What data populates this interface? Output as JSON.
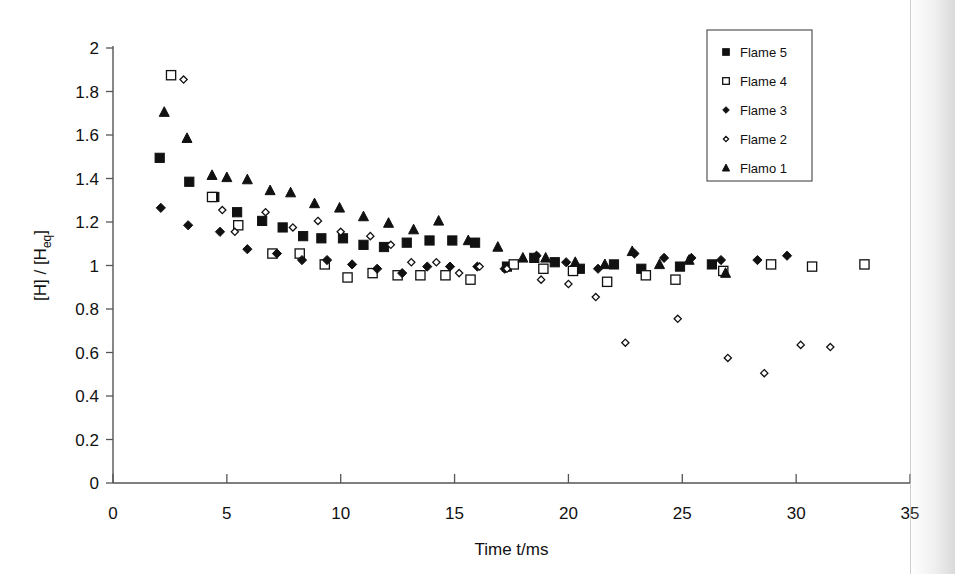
{
  "chart_data": {
    "type": "scatter",
    "title": "",
    "xlabel": "Time t/ms",
    "ylabel": "[H] / [Heq]",
    "ylabel_base": "[H] / [H",
    "ylabel_sub": "eq",
    "ylabel_close": "]",
    "xlim": [
      0,
      35
    ],
    "ylim": [
      0,
      2
    ],
    "xticks": [
      0,
      5,
      10,
      15,
      20,
      25,
      30,
      35
    ],
    "yticks": [
      0,
      0.2,
      0.4,
      0.6,
      0.8,
      1,
      1.2,
      1.4,
      1.6,
      1.8,
      2
    ],
    "xtick_labels": [
      "0",
      "5",
      "10",
      "15",
      "20",
      "25",
      "30",
      "35"
    ],
    "ytick_labels": [
      "0",
      "0.2",
      "0.4",
      "0.6",
      "0.8",
      "1",
      "1.2",
      "1.4",
      "1.6",
      "1.8",
      "2"
    ],
    "grid": false,
    "legend_position": "top-right",
    "marker_color": "#111111",
    "axis_color": "#555555",
    "series": [
      {
        "name": "Flame 5",
        "marker": "filled-square",
        "points": [
          [
            2.05,
            1.495
          ],
          [
            3.35,
            1.385
          ],
          [
            4.45,
            1.315
          ],
          [
            5.45,
            1.245
          ],
          [
            6.55,
            1.205
          ],
          [
            7.45,
            1.175
          ],
          [
            8.35,
            1.135
          ],
          [
            9.15,
            1.125
          ],
          [
            10.1,
            1.125
          ],
          [
            11.0,
            1.095
          ],
          [
            11.9,
            1.085
          ],
          [
            12.9,
            1.105
          ],
          [
            13.9,
            1.115
          ],
          [
            14.9,
            1.115
          ],
          [
            15.9,
            1.105
          ],
          [
            17.3,
            0.995
          ],
          [
            18.5,
            1.035
          ],
          [
            19.4,
            1.015
          ],
          [
            20.5,
            0.985
          ],
          [
            22.0,
            1.005
          ],
          [
            23.2,
            0.985
          ],
          [
            24.9,
            0.995
          ],
          [
            26.3,
            1.005
          ]
        ]
      },
      {
        "name": "Flame 4",
        "marker": "open-square",
        "points": [
          [
            2.55,
            1.875
          ],
          [
            4.35,
            1.315
          ],
          [
            5.5,
            1.185
          ],
          [
            7.0,
            1.055
          ],
          [
            8.2,
            1.055
          ],
          [
            9.3,
            1.005
          ],
          [
            10.3,
            0.945
          ],
          [
            11.4,
            0.965
          ],
          [
            12.5,
            0.955
          ],
          [
            13.5,
            0.955
          ],
          [
            14.6,
            0.955
          ],
          [
            15.7,
            0.935
          ],
          [
            17.6,
            1.005
          ],
          [
            18.9,
            0.985
          ],
          [
            20.2,
            0.975
          ],
          [
            21.7,
            0.925
          ],
          [
            23.4,
            0.955
          ],
          [
            24.7,
            0.935
          ],
          [
            26.8,
            0.975
          ],
          [
            28.9,
            1.005
          ],
          [
            30.7,
            0.995
          ],
          [
            33.0,
            1.005
          ]
        ]
      },
      {
        "name": "Flame 3",
        "marker": "filled-diamond",
        "points": [
          [
            2.1,
            1.265
          ],
          [
            3.3,
            1.185
          ],
          [
            4.7,
            1.155
          ],
          [
            5.9,
            1.075
          ],
          [
            7.2,
            1.055
          ],
          [
            8.3,
            1.025
          ],
          [
            9.4,
            1.025
          ],
          [
            10.5,
            1.005
          ],
          [
            11.6,
            0.985
          ],
          [
            12.7,
            0.965
          ],
          [
            13.8,
            0.995
          ],
          [
            14.8,
            0.995
          ],
          [
            16.0,
            0.995
          ],
          [
            17.2,
            0.985
          ],
          [
            18.6,
            1.045
          ],
          [
            19.9,
            1.015
          ],
          [
            21.3,
            0.985
          ],
          [
            22.9,
            1.055
          ],
          [
            24.2,
            1.035
          ],
          [
            25.4,
            1.035
          ],
          [
            26.7,
            1.025
          ],
          [
            28.3,
            1.025
          ],
          [
            29.6,
            1.045
          ]
        ]
      },
      {
        "name": "Flame 2",
        "marker": "open-diamond",
        "points": [
          [
            3.1,
            1.855
          ],
          [
            4.8,
            1.255
          ],
          [
            5.35,
            1.155
          ],
          [
            6.7,
            1.245
          ],
          [
            7.9,
            1.175
          ],
          [
            9.0,
            1.205
          ],
          [
            10.0,
            1.155
          ],
          [
            11.3,
            1.135
          ],
          [
            12.2,
            1.095
          ],
          [
            13.1,
            1.015
          ],
          [
            14.2,
            1.015
          ],
          [
            15.2,
            0.965
          ],
          [
            16.1,
            0.995
          ],
          [
            17.3,
            0.985
          ],
          [
            18.8,
            0.935
          ],
          [
            20.0,
            0.915
          ],
          [
            21.2,
            0.855
          ],
          [
            22.5,
            0.645
          ],
          [
            24.8,
            0.755
          ],
          [
            27.0,
            0.575
          ],
          [
            28.6,
            0.505
          ],
          [
            30.2,
            0.635
          ],
          [
            31.5,
            0.625
          ]
        ]
      },
      {
        "name": "Flamo 1",
        "marker": "filled-triangle",
        "points": [
          [
            2.25,
            1.705
          ],
          [
            3.25,
            1.585
          ],
          [
            4.35,
            1.415
          ],
          [
            5.0,
            1.405
          ],
          [
            5.9,
            1.395
          ],
          [
            6.9,
            1.345
          ],
          [
            7.8,
            1.335
          ],
          [
            8.85,
            1.285
          ],
          [
            9.95,
            1.265
          ],
          [
            11.0,
            1.225
          ],
          [
            12.1,
            1.195
          ],
          [
            13.2,
            1.165
          ],
          [
            14.3,
            1.205
          ],
          [
            15.6,
            1.115
          ],
          [
            16.9,
            1.085
          ],
          [
            18.0,
            1.035
          ],
          [
            19.0,
            1.035
          ],
          [
            20.3,
            1.015
          ],
          [
            21.6,
            1.005
          ],
          [
            22.8,
            1.065
          ],
          [
            24.0,
            1.005
          ],
          [
            25.3,
            1.025
          ],
          [
            26.9,
            0.965
          ]
        ]
      }
    ]
  },
  "legend": {
    "items": [
      {
        "label": "Flame 5",
        "marker": "filled-square"
      },
      {
        "label": "Flame 4",
        "marker": "open-square"
      },
      {
        "label": "Flame 3",
        "marker": "filled-diamond"
      },
      {
        "label": "Flame 2",
        "marker": "open-diamond"
      },
      {
        "label": "Flamo 1",
        "marker": "filled-triangle"
      }
    ]
  }
}
